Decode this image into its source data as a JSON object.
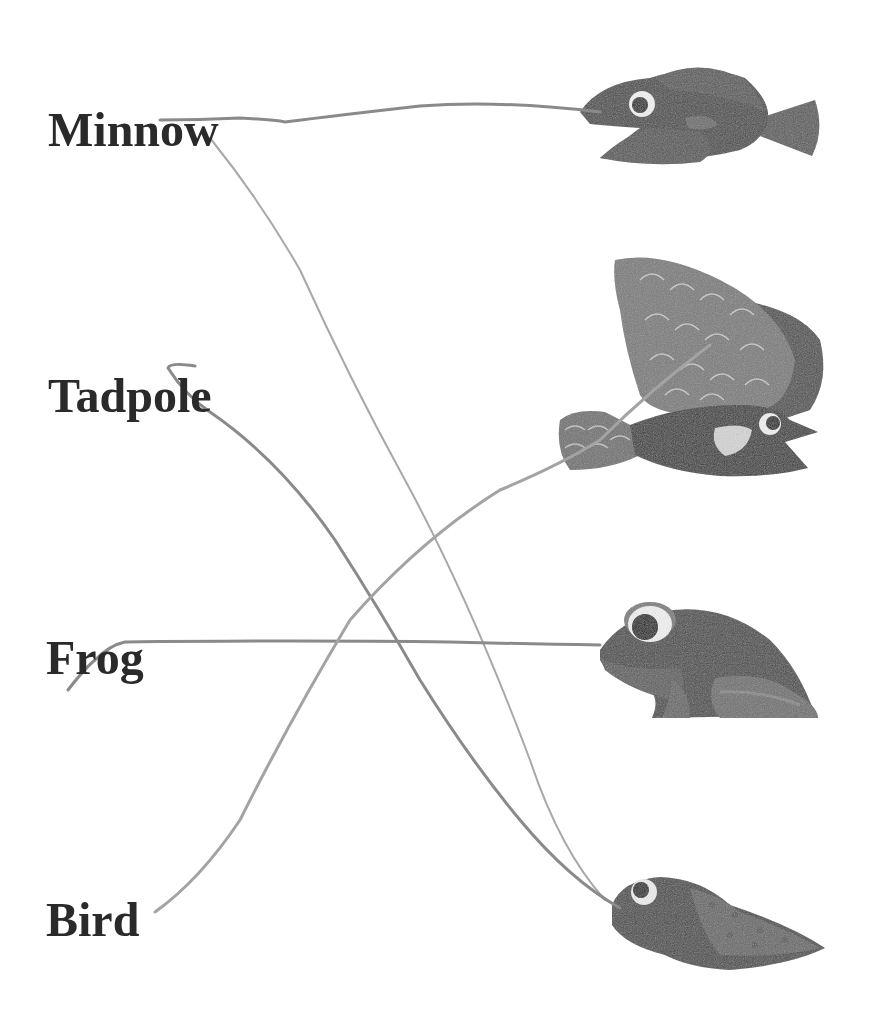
{
  "worksheet": {
    "type": "matching-exercise",
    "labels": [
      {
        "id": "minnow",
        "text": "Minnow"
      },
      {
        "id": "tadpole",
        "text": "Tadpole"
      },
      {
        "id": "frog",
        "text": "Frog"
      },
      {
        "id": "bird",
        "text": "Bird"
      }
    ],
    "pictures": [
      {
        "id": "fish",
        "depicts": "fish"
      },
      {
        "id": "bird",
        "depicts": "bird catching fish"
      },
      {
        "id": "frog",
        "depicts": "frog"
      },
      {
        "id": "tadpole",
        "depicts": "tadpole"
      }
    ],
    "drawn_connections": [
      {
        "from": "minnow",
        "to": "fish"
      },
      {
        "from": "minnow",
        "to": "tadpole"
      },
      {
        "from": "tadpole",
        "to": "tadpole"
      },
      {
        "from": "frog",
        "to": "frog"
      },
      {
        "from": "bird",
        "to": "bird"
      }
    ],
    "colors": {
      "label_text": "#2a2a2a",
      "pencil_line": "#8a8a8a",
      "pencil_line_light": "#b5b5b5",
      "illustration_dark": "#3e3e3e",
      "illustration_mid": "#6b6b6b",
      "illustration_light": "#a8a8a8",
      "background": "#ffffff"
    }
  }
}
